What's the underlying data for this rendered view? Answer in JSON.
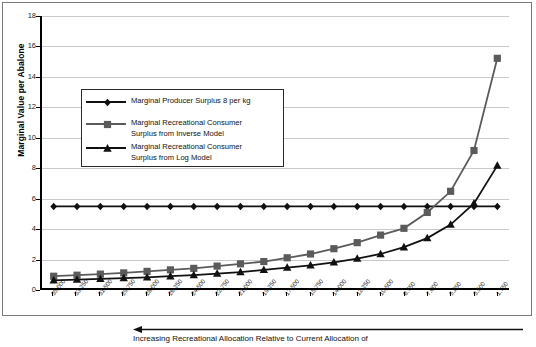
{
  "chart_data": {
    "type": "line",
    "title": "",
    "xlabel": "Increasing Recreational Allocation Relative to Current Allocation of",
    "ylabel": "Marginal Value per Abalone",
    "ylim": [
      0,
      18
    ],
    "yticks": [
      0,
      2,
      4,
      6,
      8,
      10,
      12,
      14,
      16,
      18
    ],
    "grid": true,
    "legend_position": "inside-upper-left",
    "categories": [
      "35,000",
      "33,250",
      "31,500",
      "29,750",
      "28,000",
      "26,250",
      "24,500",
      "22,750",
      "21,000",
      "19,250",
      "17,500",
      "15,750",
      "14,000",
      "12,250",
      "10,500",
      "8,750",
      "7,000",
      "5,250",
      "3,500",
      "1,750"
    ],
    "series": [
      {
        "name": "Marginal Producer Surplus 8 per kg",
        "marker": "diamond",
        "color": "#111111",
        "values": [
          5.4,
          5.4,
          5.4,
          5.4,
          5.4,
          5.4,
          5.4,
          5.4,
          5.4,
          5.4,
          5.4,
          5.4,
          5.4,
          5.4,
          5.4,
          5.4,
          5.4,
          5.4,
          5.4,
          5.4
        ]
      },
      {
        "name": "Marginal Recreational Consumer Surplus from Inverse Model",
        "marker": "square",
        "color": "#5b5b5b",
        "values": [
          0.78,
          0.85,
          0.92,
          1.0,
          1.1,
          1.2,
          1.3,
          1.45,
          1.6,
          1.75,
          2.0,
          2.25,
          2.6,
          3.0,
          3.5,
          3.95,
          5.0,
          6.4,
          9.1,
          15.2
        ]
      },
      {
        "name": "Marginal Recreational Consumer Surplus from Log Model",
        "marker": "triangle",
        "color": "#111111",
        "values": [
          0.5,
          0.55,
          0.6,
          0.65,
          0.7,
          0.78,
          0.85,
          0.95,
          1.05,
          1.2,
          1.35,
          1.5,
          1.7,
          1.95,
          2.25,
          2.7,
          3.3,
          4.2,
          5.6,
          8.1
        ]
      }
    ]
  },
  "axis": {
    "y_title": "Marginal Value per Abalone",
    "y_tick_labels": [
      "0",
      "2",
      "4",
      "6",
      "8",
      "10",
      "12",
      "14",
      "16",
      "18"
    ]
  },
  "legend": {
    "entries": [
      {
        "label": "Marginal Producer Surplus 8 per kg",
        "line2": ""
      },
      {
        "label": "Marginal Recreational Consumer",
        "line2": "Surplus from Inverse Model"
      },
      {
        "label": "Marginal Recreational Consumer",
        "line2": "Surplus from Log Model"
      }
    ]
  },
  "caption": {
    "text": "Increasing Recreational Allocation Relative to Current Allocation of",
    "arrow_direction": "left"
  },
  "colors": {
    "producer_series": "#111111",
    "inverse_series": "#5b5b5b",
    "log_series": "#111111",
    "grid": "#c9c9c9",
    "axis": "#000000",
    "frame": "#7a7a7a"
  }
}
